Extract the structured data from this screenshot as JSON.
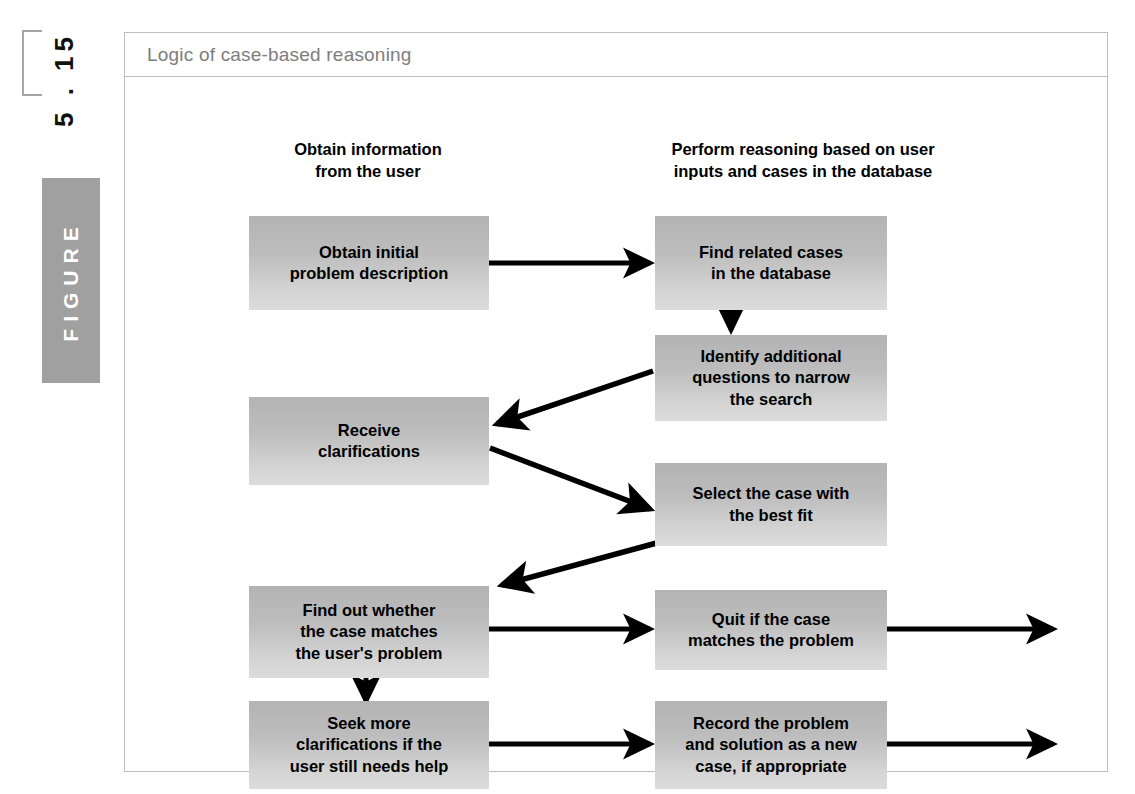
{
  "figure_label": {
    "number": "5 . 15",
    "word": "FIGURE"
  },
  "frame": {
    "title": "Logic of case-based reasoning"
  },
  "diagram": {
    "type": "flowchart",
    "columns": [
      {
        "id": "left",
        "header": "Obtain information\nfrom the user"
      },
      {
        "id": "right",
        "header": "Perform reasoning based on user\ninputs and cases in the database"
      }
    ],
    "nodes": [
      {
        "id": "n1",
        "column": "left",
        "text": "Obtain initial\nproblem description"
      },
      {
        "id": "n2",
        "column": "right",
        "text": "Find related cases\nin the database"
      },
      {
        "id": "n3",
        "column": "right",
        "text": "Identify additional\nquestions to narrow\nthe search"
      },
      {
        "id": "n4",
        "column": "left",
        "text": "Receive\nclarifications"
      },
      {
        "id": "n5",
        "column": "right",
        "text": "Select the case with\nthe best fit"
      },
      {
        "id": "n6",
        "column": "left",
        "text": "Find out whether\nthe case matches\nthe user's problem"
      },
      {
        "id": "n7",
        "column": "right",
        "text": "Quit if the case\nmatches the problem"
      },
      {
        "id": "n8",
        "column": "left",
        "text": "Seek more\nclarifications if the\nuser still needs help"
      },
      {
        "id": "n9",
        "column": "right",
        "text": "Record the problem\nand solution as a new\ncase, if appropriate"
      }
    ],
    "edges": [
      {
        "from": "n1",
        "to": "n2",
        "style": "horizontal-right"
      },
      {
        "from": "n2",
        "to": "n3",
        "style": "vertical-down"
      },
      {
        "from": "n3",
        "to": "n4",
        "style": "diagonal-down-left"
      },
      {
        "from": "n4",
        "to": "n5",
        "style": "diagonal-down-right"
      },
      {
        "from": "n5",
        "to": "n6",
        "style": "diagonal-down-left"
      },
      {
        "from": "n6",
        "to": "n7",
        "style": "horizontal-right"
      },
      {
        "from": "n7",
        "to": "exit-1",
        "style": "horizontal-right-exit"
      },
      {
        "from": "n6",
        "to": "n8",
        "style": "vertical-down"
      },
      {
        "from": "n8",
        "to": "n9",
        "style": "horizontal-right"
      },
      {
        "from": "n9",
        "to": "exit-2",
        "style": "horizontal-right-exit"
      }
    ]
  },
  "colors": {
    "frame_border": "#bdbdbd",
    "title_text": "#7d7d7d",
    "node_fill_top": "#b3b3b3",
    "node_fill_bottom": "#dcdcdc",
    "node_text": "#000000",
    "arrow": "#000000",
    "figure_box": "#a0a0a0"
  }
}
